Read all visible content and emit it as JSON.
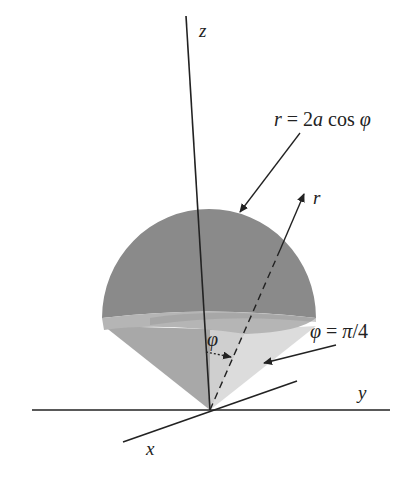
{
  "diagram": {
    "axes": {
      "z": "z",
      "y": "y",
      "x": "x"
    },
    "labels": {
      "sphere_eq": {
        "lhs": "r",
        "eq": " = 2",
        "a": "a",
        "cos": " cos ",
        "phi": "φ"
      },
      "radius": "r",
      "angle": "φ",
      "cone_eq": {
        "phi": "φ",
        "eq": " = ",
        "pi": "π",
        "rest": "/4"
      }
    },
    "colors": {
      "cap": "#8a8a8a",
      "cap_band": "#b8b8b8",
      "cone_left": "#a8a8a8",
      "cone_right": "#dcdcdc",
      "lines": "#222222"
    }
  }
}
